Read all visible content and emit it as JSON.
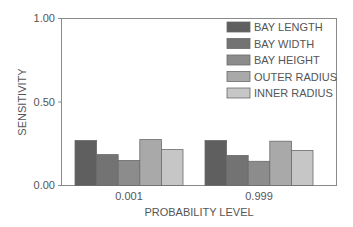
{
  "chart_data": {
    "type": "bar",
    "title": "",
    "xlabel": "PROBABILITY LEVEL",
    "ylabel": "SENSITIVITY",
    "ylim": [
      0,
      1.0
    ],
    "yticks": [
      "0.00",
      "0.50",
      "1.00"
    ],
    "categories": [
      "0.001",
      "0.999"
    ],
    "grid": false,
    "legend_position": "upper right",
    "series": [
      {
        "name": "BAY LENGTH",
        "color": "#5f5f5f",
        "values": [
          0.27,
          0.27
        ]
      },
      {
        "name": "BAY WIDTH",
        "color": "#737373",
        "values": [
          0.185,
          0.18
        ]
      },
      {
        "name": "BAY HEIGHT",
        "color": "#8c8c8c",
        "values": [
          0.15,
          0.145
        ]
      },
      {
        "name": "OUTER RADIUS",
        "color": "#a9a9a9",
        "values": [
          0.275,
          0.265
        ]
      },
      {
        "name": "INNER RADIUS",
        "color": "#c6c6c6",
        "values": [
          0.215,
          0.21
        ]
      }
    ]
  }
}
